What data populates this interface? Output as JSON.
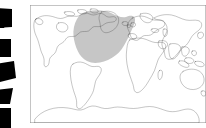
{
  "figure": {
    "kind": "world-map-outline",
    "background_color": "#ffffff"
  },
  "map": {
    "frame": {
      "stroke_color": "#8a8a8a",
      "fill_color": "#ffffff",
      "x": 30,
      "y": 5,
      "width": 176,
      "height": 118
    },
    "coastline": {
      "stroke_color": "#2b2b2b",
      "label": "world-coastline-outline"
    },
    "projection_note": "equirectangular world outline, Atlantic-centered-left",
    "landmasses": [
      "North America",
      "Greenland",
      "South America",
      "Europe",
      "Africa",
      "Asia",
      "Australia",
      "Antarctica"
    ],
    "highlight": {
      "name": "north-atlantic-region",
      "fill_color": "#c6c6c6",
      "description": "shaded region over the North Atlantic spanning eastern North America, Greenland and Western Europe"
    }
  },
  "edge_graphic": {
    "name": "left-edge-chevron-strip",
    "fill_color": "#000000",
    "count": 5,
    "description": "cropped black angled wedge marks along the left border"
  }
}
